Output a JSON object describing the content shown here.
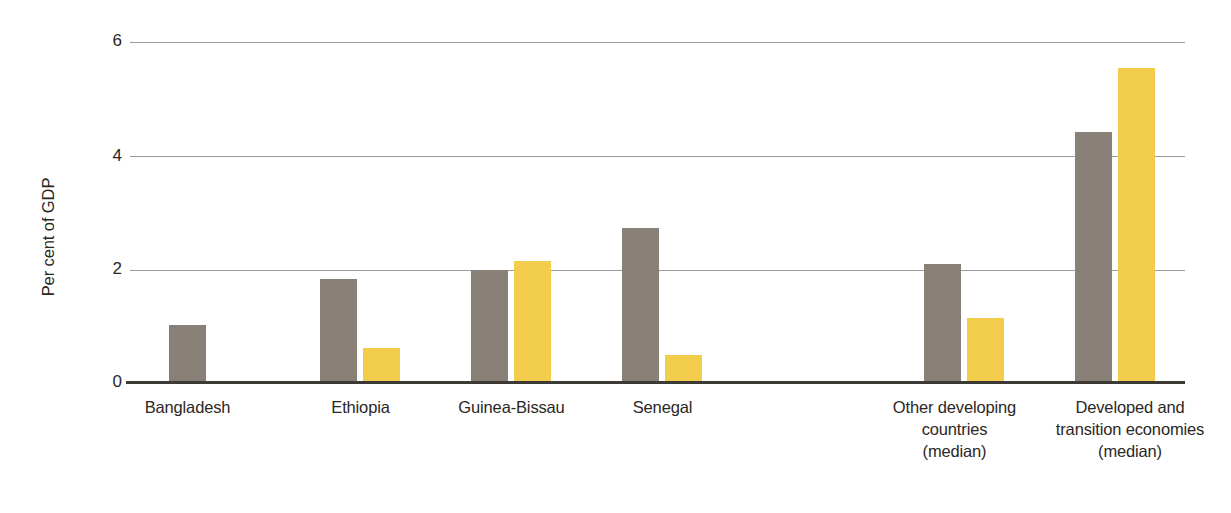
{
  "chart_data": {
    "type": "bar",
    "title": "",
    "subtitle": "",
    "xlabel": "",
    "ylabel": "Per cent of GDP",
    "ylim": [
      0,
      6
    ],
    "yticks": [
      0,
      2,
      4,
      6
    ],
    "ytick_labels": [
      "0",
      "2",
      "4",
      "6"
    ],
    "grid": "horizontal",
    "legend": "none",
    "annotations": [],
    "colors": {
      "series_1": "#888077",
      "series_2": "#f2cd4b",
      "gridline": "#9b9b9b",
      "axis": "#3d3a36",
      "text": "#2b2724",
      "background": "#ffffff"
    },
    "categories": [
      "Bangladesh",
      "Ethiopia",
      "Guinea-Bissau",
      "Senegal",
      "Other developing countries (median)",
      "Developed and transition economies (median)"
    ],
    "category_label_lines": [
      [
        "Bangladesh"
      ],
      [
        "Ethiopia"
      ],
      [
        "Guinea-Bissau"
      ],
      [
        "Senegal"
      ],
      [
        "Other developing",
        "countries",
        "(median)"
      ],
      [
        "Developed and",
        "transition economies",
        "(median)"
      ]
    ],
    "series": [
      {
        "name": "series_1",
        "color": "#888077",
        "values": [
          1.02,
          1.83,
          1.98,
          2.72,
          2.1,
          4.42
        ]
      },
      {
        "name": "series_2",
        "color": "#f2cd4b",
        "values": [
          null,
          0.62,
          2.15,
          0.5,
          1.15,
          5.55
        ]
      }
    ]
  },
  "axis": {
    "ytick_0": "0",
    "ytick_2": "2",
    "ytick_4": "4",
    "ytick_6": "6",
    "ylabel": "Per cent of GDP"
  },
  "labels": {
    "bangladesh": "Bangladesh",
    "ethiopia": "Ethiopia",
    "guinea_bissau": "Guinea-Bissau",
    "senegal": "Senegal",
    "other_dev_l1": "Other developing",
    "other_dev_l2": "countries",
    "other_dev_l3": "(median)",
    "developed_l1": "Developed and",
    "developed_l2": "transition economies",
    "developed_l3": "(median)"
  }
}
